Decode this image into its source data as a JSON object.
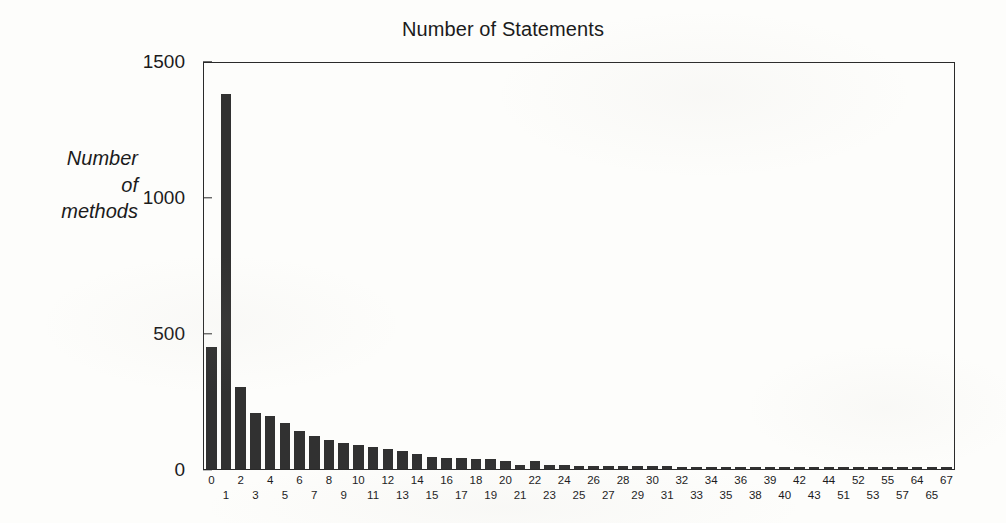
{
  "chart_data": {
    "type": "bar",
    "title": "Number of Statements",
    "xlabel": "",
    "ylabel": "Number of methods",
    "ylabel_lines": [
      "Number",
      "of",
      "methods"
    ],
    "ylim": [
      0,
      1500
    ],
    "yticks": [
      0,
      500,
      1000,
      1500
    ],
    "ytick_labels": [
      "0",
      "500",
      "1000",
      "1500"
    ],
    "grid": false,
    "legend": null,
    "bar_color": "#313131",
    "axis_color": "#2a2a2a",
    "background_color": "#fdfdfb",
    "label_stagger": true,
    "categories": [
      "0",
      "1",
      "2",
      "3",
      "4",
      "5",
      "6",
      "7",
      "8",
      "9",
      "10",
      "11",
      "12",
      "13",
      "14",
      "15",
      "16",
      "17",
      "18",
      "19",
      "20",
      "21",
      "22",
      "23",
      "24",
      "25",
      "26",
      "27",
      "28",
      "29",
      "30",
      "31",
      "32",
      "33",
      "34",
      "35",
      "36",
      "38",
      "39",
      "40",
      "42",
      "43",
      "44",
      "51",
      "52",
      "53",
      "55",
      "57",
      "64",
      "65",
      "67"
    ],
    "values": [
      450,
      1380,
      300,
      205,
      195,
      170,
      140,
      120,
      105,
      95,
      88,
      80,
      72,
      68,
      55,
      45,
      42,
      40,
      38,
      35,
      28,
      14,
      30,
      16,
      14,
      12,
      12,
      11,
      11,
      10,
      10,
      10,
      9,
      9,
      9,
      8,
      8,
      8,
      8,
      7,
      7,
      7,
      7,
      7,
      6,
      6,
      6,
      6,
      6,
      5,
      5
    ]
  }
}
